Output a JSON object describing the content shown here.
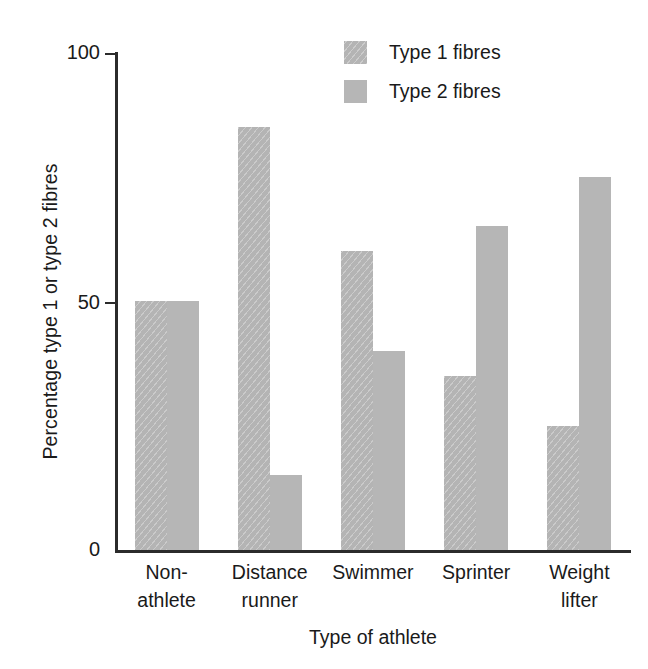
{
  "chart_data": {
    "type": "bar",
    "title": "",
    "xlabel": "Type of athlete",
    "ylabel": "Percentage type 1 or type 2 fibres",
    "categories": [
      "Non-athlete",
      "Distance runner",
      "Swimmer",
      "Sprinter",
      "Weight lifter"
    ],
    "category_lines": [
      [
        "Non-",
        "athlete"
      ],
      [
        "Distance",
        "runner"
      ],
      [
        "Swimmer",
        ""
      ],
      [
        "Sprinter",
        ""
      ],
      [
        "Weight",
        "lifter"
      ]
    ],
    "series": [
      {
        "name": "Type 1 fibres",
        "values": [
          50,
          85,
          60,
          35,
          25
        ],
        "color": "#b4b4b4",
        "pattern": "diagonal-hatch"
      },
      {
        "name": "Type 2 fibres",
        "values": [
          50,
          15,
          40,
          65,
          75
        ],
        "color": "#b6b6b6",
        "pattern": "solid"
      }
    ],
    "ylim": [
      0,
      100
    ],
    "yticks": [
      0,
      50,
      100
    ],
    "ytick_labels": [
      "0",
      "50",
      "100"
    ],
    "grid": false,
    "legend_position": "top-right"
  },
  "axis": {
    "y_title": "Percentage type 1 or type 2 fibres",
    "x_title": "Type of athlete",
    "tick_100": "100",
    "tick_50": "50",
    "tick_0": "0"
  },
  "legend": {
    "items": [
      {
        "label": "Type 1 fibres"
      },
      {
        "label": "Type 2 fibres"
      }
    ]
  },
  "categories": [
    {
      "line1": "Non-",
      "line2": "athlete"
    },
    {
      "line1": "Distance",
      "line2": "runner"
    },
    {
      "line1": "Swimmer",
      "line2": ""
    },
    {
      "line1": "Sprinter",
      "line2": ""
    },
    {
      "line1": "Weight",
      "line2": "lifter"
    }
  ]
}
